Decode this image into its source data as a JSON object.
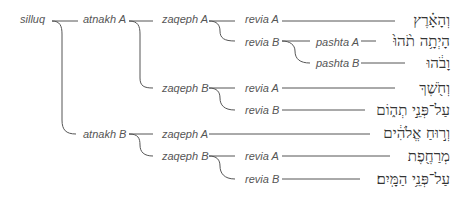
{
  "diagram": {
    "root": "silluq",
    "level1": [
      "atnakh A",
      "atnakh B"
    ],
    "level2": {
      "atnakh_A": [
        "zaqeph A",
        "zaqeph B"
      ],
      "atnakh_B": [
        "zaqeph A",
        "zaqeph B"
      ]
    },
    "level3": {
      "aA_zA": [
        "revia A",
        "revia B"
      ],
      "aA_zB": [
        "revia A",
        "revia B"
      ],
      "aB_zB": [
        "revia A",
        "revia B"
      ]
    },
    "level4": {
      "aA_zA_rB": [
        "pashta A",
        "pashta B"
      ]
    },
    "hebrew": [
      "וְהָאָ֗רֶץ",
      "הָיְתָ֥ה תֹ֨הוּ֙",
      "וָבֹ֔הוּ",
      "וְחֹ֖שֶׁךְ",
      "עַל־פְּנֵ֣י תְה֑וֹם",
      "וְר֣וּחַ אֱלֹהִ֔ים",
      "מְרַחֶ֖פֶת",
      "עַל־פְּנֵ֥י הַמָּֽיִם׃"
    ]
  }
}
